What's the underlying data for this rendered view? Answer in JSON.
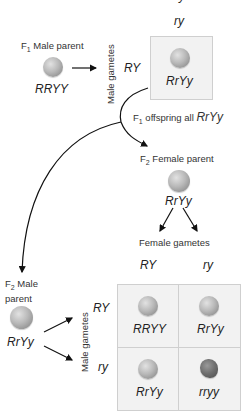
{
  "top_cutoff_label": "ry",
  "f1_cross": {
    "male_parent_label": "F1 Male parent",
    "male_parent_genotype": "RRYY",
    "male_gametes_label": "Male gametes",
    "male_gamete": "RY",
    "female_gamete": "ry",
    "offspring_genotype": "RrYy",
    "offspring_caption": "F1 offspring all RrYy"
  },
  "f2_female": {
    "label": "F2 Female parent",
    "genotype": "RrYy",
    "gametes_label": "Female gametes",
    "gametes": [
      "RY",
      "ry"
    ]
  },
  "f2_male": {
    "label_line1": "F2 Male",
    "label_line2": "parent",
    "genotype": "RrYy",
    "gametes_label": "Male gametes",
    "gametes": [
      "RY",
      "ry"
    ]
  },
  "punnett": {
    "cells": [
      {
        "genotype": "RRYY",
        "phenotype": "round-yellow"
      },
      {
        "genotype": "RrYy",
        "phenotype": "round-yellow"
      },
      {
        "genotype": "RrYy",
        "phenotype": "round-yellow"
      },
      {
        "genotype": "rryy",
        "phenotype": "wrinkled-green"
      }
    ]
  }
}
